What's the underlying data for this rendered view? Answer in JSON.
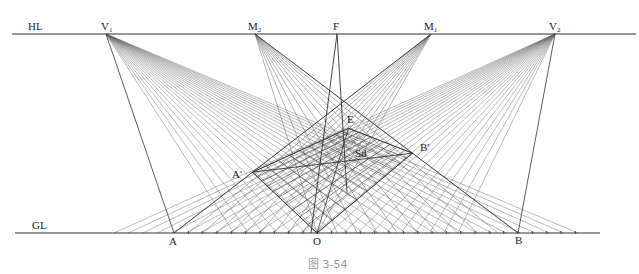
{
  "diagram": {
    "caption": "图 3-54",
    "lines": {
      "horizon_label": "HL",
      "ground_label": "GL"
    },
    "points": {
      "V1": {
        "base": "V",
        "sub": "1"
      },
      "M2": {
        "base": "M",
        "sub": "2"
      },
      "F": {
        "base": "F",
        "sub": ""
      },
      "M1": {
        "base": "M",
        "sub": "1"
      },
      "V2": {
        "base": "V",
        "sub": "2"
      },
      "A": {
        "base": "A",
        "sub": ""
      },
      "O": {
        "base": "O",
        "sub": ""
      },
      "B": {
        "base": "B",
        "sub": ""
      },
      "A_prime": {
        "base": "A'",
        "sub": ""
      },
      "B_prime": {
        "base": "B'",
        "sub": ""
      },
      "E": {
        "base": "E",
        "sub": ""
      },
      "Sd": {
        "base": "Sd",
        "sub": ""
      }
    },
    "grid_divisions_per_side": 10,
    "ground_ticks_beyond_B": 4,
    "colors": {
      "line": "#333333",
      "construction": "#555555",
      "caption": "#999999"
    }
  }
}
